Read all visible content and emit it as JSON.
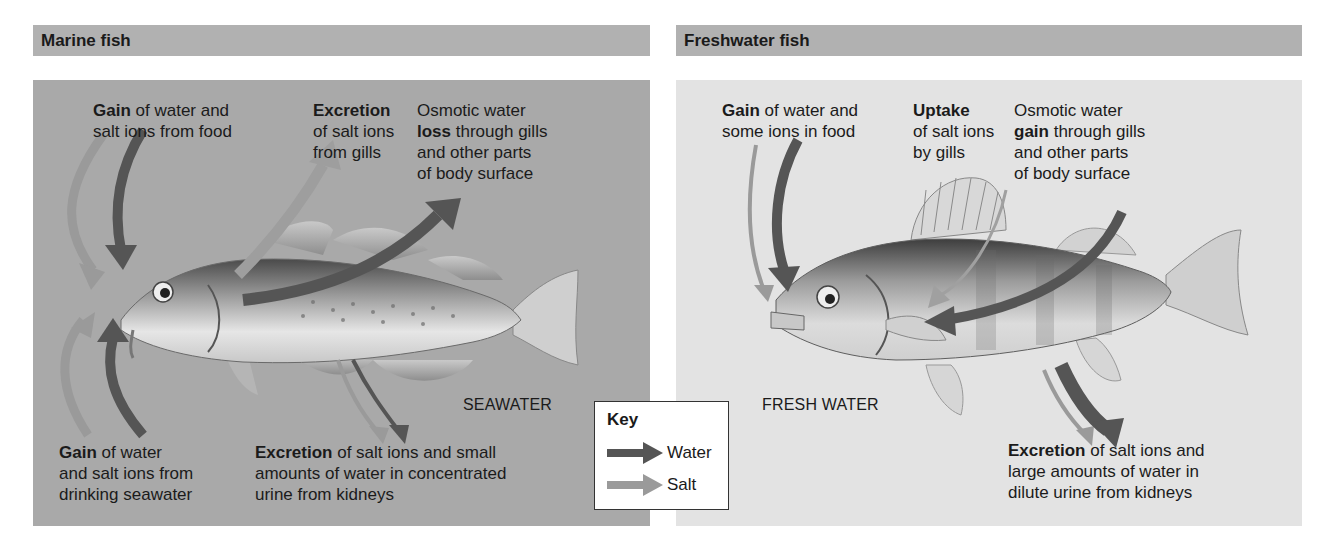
{
  "panels": {
    "marine": {
      "title": "Marine fish",
      "environment_label": "SEAWATER",
      "background_color": "#a9a9a9",
      "labels": {
        "food_gain": {
          "bold": "Gain",
          "line1_rest": " of water and",
          "line2": "salt ions from food"
        },
        "gill_excretion": {
          "bold": "Excretion",
          "line2": "of salt ions",
          "line3": "from gills"
        },
        "osmotic_loss": {
          "line1": "Osmotic water",
          "bold": "loss",
          "line2_rest": " through gills",
          "line3": "and other parts",
          "line4": "of body surface"
        },
        "drinking_gain": {
          "bold": "Gain",
          "line1_rest": " of water",
          "line2": "and salt ions from",
          "line3": "drinking seawater"
        },
        "kidney_excretion": {
          "bold": "Excretion",
          "line1_rest": " of salt ions and small",
          "line2": "amounts of water in concentrated",
          "line3": "urine from kidneys"
        }
      }
    },
    "freshwater": {
      "title": "Freshwater fish",
      "environment_label": "FRESH WATER",
      "background_color": "#e3e3e3",
      "labels": {
        "food_gain": {
          "bold": "Gain",
          "line1_rest": " of water and",
          "line2": "some ions in food"
        },
        "gill_uptake": {
          "bold": "Uptake",
          "line2": "of salt ions",
          "line3": "by gills"
        },
        "osmotic_gain": {
          "line1": "Osmotic water",
          "bold": "gain",
          "line2_rest": " through gills",
          "line3": "and other parts",
          "line4": "of body surface"
        },
        "kidney_excretion": {
          "bold": "Excretion",
          "line1_rest": " of salt ions and",
          "line2": "large amounts of water in",
          "line3": "dilute urine from kidneys"
        }
      }
    }
  },
  "key": {
    "title": "Key",
    "items": [
      {
        "label": "Water",
        "color": "#555555"
      },
      {
        "label": "Salt",
        "color": "#9a9a9a"
      }
    ]
  },
  "colors": {
    "water_arrow": "#555555",
    "salt_arrow": "#9a9a9a",
    "heading_bar": "#b1b1b1"
  }
}
